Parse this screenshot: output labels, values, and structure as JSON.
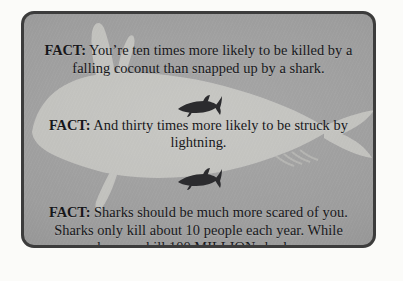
{
  "poster": {
    "background_color": "#fbfbf9",
    "card": {
      "background_color": "#9d9d9d",
      "border_color": "#3c3c3c",
      "text_color": "#17171a"
    }
  },
  "facts": [
    {
      "label": "FACT:",
      "text": " You’re ten times more likely to be killed by a falling coconut than snapped up by a shark."
    },
    {
      "label": "FACT:",
      "text": " And thirty times more likely to be struck by lightning."
    },
    {
      "label": "FACT:",
      "text": " Sharks should be much more scared of you. Sharks only kill about 10 people each year. While humans kill 100 MILLION sharks."
    }
  ],
  "graphics": {
    "background_watermark": "large-shark-silhouette",
    "divider_1": "small-shark-silhouette",
    "divider_2": "small-shark-silhouette",
    "watermark_color": "#d9d9d4",
    "divider_color": "#2b2b2e"
  }
}
